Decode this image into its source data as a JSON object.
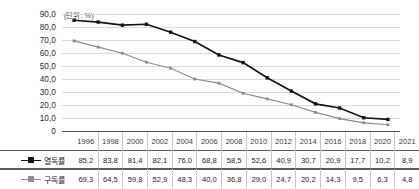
{
  "chart_data": {
    "type": "line",
    "title": "",
    "subtitle": "",
    "unit_label": "(단위: %)",
    "xlabel": "",
    "ylabel": "",
    "ylim": [
      0,
      90
    ],
    "ytick_labels": [
      "90,0",
      "80,0",
      "70,0",
      "60,0",
      "50,0",
      "40,0",
      "30,0",
      "20,0",
      "10,0",
      "0"
    ],
    "ytick_values": [
      90,
      80,
      70,
      60,
      50,
      40,
      30,
      20,
      10,
      0
    ],
    "grid": true,
    "legend_position": "table-left",
    "categories": [
      "1996",
      "1998",
      "2000",
      "2002",
      "2004",
      "2006",
      "2008",
      "2010",
      "2012",
      "2014",
      "2016",
      "2018",
      "2020",
      "2021"
    ],
    "series": [
      {
        "name": "열독률",
        "color": "#141414",
        "marker": "square",
        "values": [
          85.2,
          83.8,
          81.4,
          82.1,
          76.0,
          68.8,
          58.5,
          52.6,
          40.9,
          30.7,
          20.9,
          17.7,
          10.2,
          8.9
        ],
        "value_labels": [
          "85,2",
          "83,8",
          "81,4",
          "82,1",
          "76,0",
          "68,8",
          "58,5",
          "52,6",
          "40,9",
          "30,7",
          "20,9",
          "17,7",
          "10,2",
          "8,9"
        ]
      },
      {
        "name": "구독률",
        "color": "#8c8c8c",
        "marker": "square",
        "values": [
          69.3,
          64.5,
          59.8,
          52.9,
          48.3,
          40.0,
          36.8,
          29.0,
          24.7,
          20.2,
          14.3,
          9.5,
          6.3,
          4.8
        ],
        "value_labels": [
          "69,3",
          "64,5",
          "59,8",
          "52,9",
          "48,3",
          "40,0",
          "36,8",
          "29,0",
          "24,7",
          "20,2",
          "14,3",
          "9,5",
          "6,3",
          "4,8"
        ]
      }
    ]
  },
  "table": {
    "corner_label": "",
    "year_headers": [
      "1996",
      "1998",
      "2000",
      "2002",
      "2004",
      "2006",
      "2008",
      "2010",
      "2012",
      "2014",
      "2016",
      "2018",
      "2020",
      "2021"
    ],
    "rows": [
      {
        "legend": "열독률",
        "values": [
          "85,2",
          "83,8",
          "81,4",
          "82,1",
          "76,0",
          "68,8",
          "58,5",
          "52,6",
          "40,9",
          "30,7",
          "20,9",
          "17,7",
          "10,2",
          "8,9"
        ]
      },
      {
        "legend": "구독률",
        "values": [
          "69,3",
          "64,5",
          "59,8",
          "52,9",
          "48,3",
          "40,0",
          "36,8",
          "29,0",
          "24,7",
          "20,2",
          "14,3",
          "9,5",
          "6,3",
          "4,8"
        ]
      }
    ]
  },
  "colors": {
    "series1": "#141414",
    "series2": "#8c8c8c",
    "gridline": "#d9d9d9",
    "axis": "#555555",
    "table_rule": "#5a5a5a",
    "table_divider": "#c8c8c8"
  }
}
